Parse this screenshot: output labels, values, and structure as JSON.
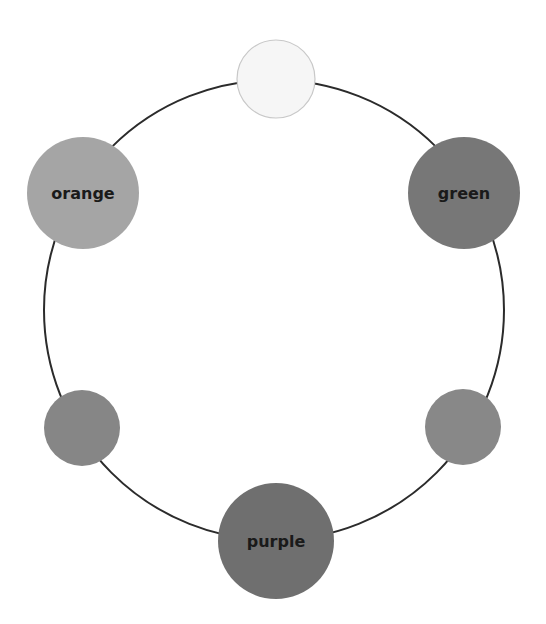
{
  "diagram": {
    "type": "color-wheel-ring",
    "ring": {
      "cx": 274,
      "cy": 310,
      "r": 230,
      "stroke": "#2b2b2b",
      "stroke_width": 2
    },
    "nodes": [
      {
        "id": "top",
        "label": "",
        "cx": 276,
        "cy": 79,
        "r": 39,
        "fill": "#f6f6f6",
        "stroke": "#c8c8c8"
      },
      {
        "id": "green",
        "label": "green",
        "cx": 464,
        "cy": 193,
        "r": 56,
        "fill": "#777777",
        "stroke": "none"
      },
      {
        "id": "bottom-right",
        "label": "",
        "cx": 463,
        "cy": 427,
        "r": 38,
        "fill": "#888888",
        "stroke": "none"
      },
      {
        "id": "purple",
        "label": "purple",
        "cx": 276,
        "cy": 541,
        "r": 58,
        "fill": "#6f6f6f",
        "stroke": "none"
      },
      {
        "id": "bottom-left",
        "label": "",
        "cx": 82,
        "cy": 428,
        "r": 38,
        "fill": "#868686",
        "stroke": "none"
      },
      {
        "id": "orange",
        "label": "orange",
        "cx": 83,
        "cy": 193,
        "r": 56,
        "fill": "#a5a5a5",
        "stroke": "none"
      }
    ]
  }
}
